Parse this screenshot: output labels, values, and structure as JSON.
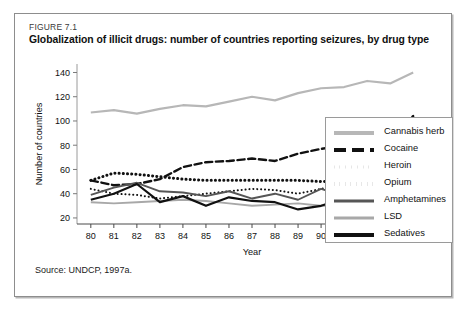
{
  "figure": {
    "number": "FIGURE 7.1",
    "title": "Globalization of illicit drugs: number of countries reporting seizures, by drug type",
    "source": "Source: UNDCP, 1997a."
  },
  "chart_data": {
    "type": "line",
    "title": "Globalization of illicit drugs: number of countries reporting seizures, by drug type",
    "xlabel": "Year",
    "ylabel": "Number of countries",
    "categories": [
      "80",
      "81",
      "82",
      "83",
      "84",
      "85",
      "86",
      "87",
      "88",
      "89",
      "90",
      "91",
      "92",
      "93",
      "94"
    ],
    "x": [
      80,
      81,
      82,
      83,
      84,
      85,
      86,
      87,
      88,
      89,
      90,
      91,
      92,
      93,
      94
    ],
    "xlim": [
      79.4,
      94.6
    ],
    "ylim": [
      15,
      147
    ],
    "yticks": [
      20,
      40,
      60,
      80,
      100,
      120,
      140
    ],
    "grid": false,
    "legend_position": "right",
    "series": [
      {
        "name": "Cannabis herb",
        "style": "solid",
        "color": "#b7b7b7",
        "width": 2.2,
        "values": [
          107,
          109,
          106,
          110,
          113,
          112,
          116,
          120,
          117,
          123,
          127,
          128,
          133,
          131,
          140
        ]
      },
      {
        "name": "Cocaine",
        "style": "dashed",
        "color": "#111111",
        "width": 2.4,
        "values": [
          51,
          47,
          48,
          52,
          62,
          66,
          67,
          69,
          67,
          73,
          77,
          80,
          88,
          92,
          104
        ]
      },
      {
        "name": "Heroin",
        "style": "dotted-fine",
        "color": "#111111",
        "width": 2.0,
        "values": [
          44,
          40,
          39,
          36,
          38,
          40,
          42,
          44,
          43,
          40,
          44,
          48,
          52,
          56,
          64
        ]
      },
      {
        "name": "Opium",
        "style": "dotted-thick",
        "color": "#111111",
        "width": 3.0,
        "values": [
          51,
          57,
          56,
          54,
          52,
          51,
          51,
          51,
          51,
          51,
          50,
          51,
          53,
          52,
          52
        ]
      },
      {
        "name": "Amphetamines",
        "style": "solid",
        "color": "#565656",
        "width": 1.9,
        "values": [
          39,
          45,
          49,
          42,
          41,
          38,
          42,
          36,
          40,
          35,
          44,
          38,
          47,
          38,
          59
        ]
      },
      {
        "name": "LSD",
        "style": "solid",
        "color": "#a8a8a8",
        "width": 1.9,
        "values": [
          33,
          32,
          33,
          34,
          35,
          34,
          32,
          30,
          31,
          32,
          30,
          30,
          27,
          25,
          37
        ]
      },
      {
        "name": "Sedatives",
        "style": "solid",
        "color": "#111111",
        "width": 2.2,
        "values": [
          35,
          40,
          48,
          33,
          38,
          30,
          37,
          34,
          33,
          27,
          30,
          36,
          27,
          20,
          32
        ]
      }
    ]
  },
  "legend": {
    "items": [
      {
        "label": "Cannabis herb",
        "style": "solid",
        "color": "#b7b7b7",
        "thickness": 4
      },
      {
        "label": "Cocaine",
        "style": "dashed",
        "color": "#111111",
        "thickness": 4
      },
      {
        "label": "Heroin",
        "style": "dotted-fine",
        "color": "#111111",
        "thickness": 3
      },
      {
        "label": "Opium",
        "style": "dotted-thick",
        "color": "#111111",
        "thickness": 4
      },
      {
        "label": "Amphetamines",
        "style": "solid",
        "color": "#565656",
        "thickness": 3
      },
      {
        "label": "LSD",
        "style": "solid",
        "color": "#a8a8a8",
        "thickness": 3
      },
      {
        "label": "Sedatives",
        "style": "solid",
        "color": "#111111",
        "thickness": 4
      }
    ]
  }
}
